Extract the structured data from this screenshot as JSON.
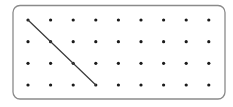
{
  "diagram": {
    "type": "dot-grid",
    "frame": {
      "x": 13,
      "y": 5.5,
      "width": 212,
      "height": 93.5,
      "radius": 7,
      "stroke": "#8a8a8a",
      "stroke_width": 1.3
    },
    "grid": {
      "columns": 9,
      "rows": 4,
      "x_positions": [
        28,
        50.6,
        73.2,
        95.8,
        118.4,
        141,
        163.6,
        186.2,
        208.8
      ],
      "y_positions": [
        20,
        41.7,
        63.3,
        85
      ],
      "dot_radius": 1.6,
      "dot_color": "#1a1a1a"
    },
    "segments": [
      {
        "from": {
          "col": 0,
          "row": 0
        },
        "to": {
          "col": 3,
          "row": 3
        },
        "color": "#3a3a3a",
        "width": 1.2
      }
    ]
  }
}
